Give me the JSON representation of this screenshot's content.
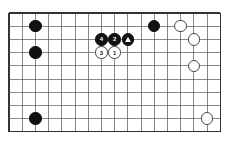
{
  "diagram": {
    "type": "go-board-diagram",
    "board": {
      "columns": 17,
      "rows": 10,
      "left": 9,
      "top": 13,
      "cell": 13.2,
      "line_color": "#555555",
      "border_color": "#333333",
      "background": "#ffffff"
    },
    "colors": {
      "black_stone": "#111111",
      "white_stone": "#ffffff",
      "white_stone_border": "#4a4a4a",
      "black_label": "#ffffff",
      "white_label": "#222222"
    },
    "stones": [
      {
        "name": "black-stone-c8",
        "color": "black",
        "col": 2,
        "row": 1,
        "label": "",
        "mark": ""
      },
      {
        "name": "black-stone-c6",
        "color": "black",
        "col": 2,
        "row": 3,
        "label": "",
        "mark": ""
      },
      {
        "name": "black-stone-4",
        "color": "black",
        "col": 7,
        "row": 2,
        "label": "4",
        "mark": "number"
      },
      {
        "name": "black-stone-2",
        "color": "black",
        "col": 8,
        "row": 2,
        "label": "2",
        "mark": "number"
      },
      {
        "name": "black-stone-tri",
        "color": "black",
        "col": 9,
        "row": 2,
        "label": "",
        "mark": "triangle"
      },
      {
        "name": "white-stone-3",
        "color": "white",
        "col": 7,
        "row": 3,
        "label": "3",
        "mark": "number"
      },
      {
        "name": "white-stone-1",
        "color": "white",
        "col": 8,
        "row": 3,
        "label": "1",
        "mark": "number"
      },
      {
        "name": "black-stone-l8",
        "color": "black",
        "col": 11,
        "row": 1,
        "label": "",
        "mark": ""
      },
      {
        "name": "white-stone-n8",
        "color": "white",
        "col": 13,
        "row": 1,
        "label": "",
        "mark": ""
      },
      {
        "name": "white-stone-o7",
        "color": "white",
        "col": 14,
        "row": 2,
        "label": "",
        "mark": ""
      },
      {
        "name": "white-stone-o5",
        "color": "white",
        "col": 14,
        "row": 4,
        "label": "",
        "mark": ""
      },
      {
        "name": "black-stone-b1",
        "color": "black",
        "col": 2,
        "row": 8,
        "label": "",
        "mark": ""
      },
      {
        "name": "white-stone-p1",
        "color": "white",
        "col": 15,
        "row": 8,
        "label": "",
        "mark": ""
      }
    ]
  }
}
